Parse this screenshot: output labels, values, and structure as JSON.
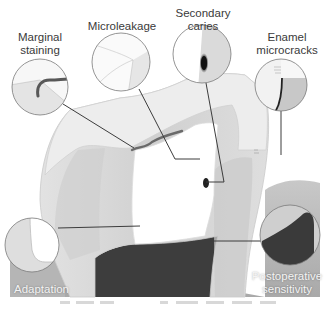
{
  "figure": {
    "callouts": [
      {
        "id": "marginal-staining",
        "lines": [
          "Marginal",
          "staining"
        ]
      },
      {
        "id": "microleakage",
        "lines": [
          "Microleakage"
        ]
      },
      {
        "id": "secondary-caries",
        "lines": [
          "Secondary",
          "caries"
        ]
      },
      {
        "id": "enamel-microcracks",
        "lines": [
          "Enamel",
          "microcracks"
        ]
      },
      {
        "id": "adaptation",
        "lines": [
          "Adaptation"
        ]
      },
      {
        "id": "postoperative-sensitivity",
        "lines": [
          "Postoperative",
          "sensitivity"
        ]
      }
    ]
  },
  "colors": {
    "background": "#ffffff",
    "enamel": "#ececec",
    "dentin": "#d6d6d6",
    "gum": "#b9b9b9",
    "pulp": "#3a3a3a",
    "restoration": "#ffffff",
    "leader_line": "#3c3c3c",
    "circle_stroke": "#7a7a7a",
    "stain": "#555555"
  }
}
